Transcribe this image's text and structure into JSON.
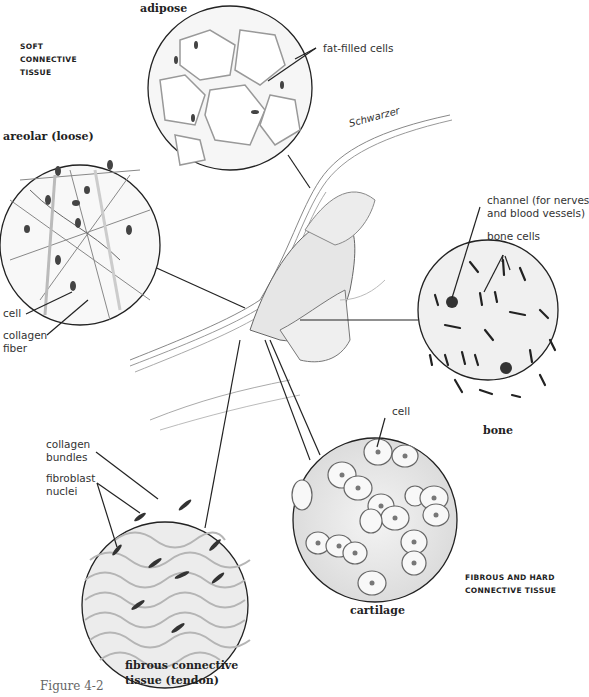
{
  "figure": {
    "caption": "Figure 4-2",
    "credit": "Schwarzer"
  },
  "groups": {
    "soft": [
      "SOFT",
      "CONNECTIVE",
      "TISSUE"
    ],
    "hard": [
      "FIBROUS AND HARD",
      "CONNECTIVE TISSUE"
    ]
  },
  "panels": {
    "adipose": {
      "title": "adipose",
      "labels": [
        "fat-filled cells"
      ]
    },
    "areolar": {
      "title": "areolar (loose)",
      "labels": [
        "cell",
        "collagen",
        "fiber"
      ]
    },
    "bone": {
      "title": "bone",
      "labels": [
        "channel (for nerves",
        "and blood vessels)",
        "bone cells"
      ]
    },
    "cartilage": {
      "title": "cartilage",
      "labels": [
        "cell"
      ]
    },
    "tendon": {
      "title_line1": "fibrous connective",
      "title_line2": "tissue (tendon)",
      "labels": [
        "collagen",
        "bundles",
        "fibroblast",
        "nuclei"
      ]
    }
  }
}
